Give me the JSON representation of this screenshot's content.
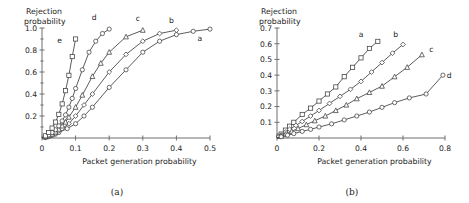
{
  "figure": {
    "panels": [
      {
        "caption": "(a)"
      },
      {
        "caption": "(b)"
      }
    ]
  },
  "chart_data": [
    {
      "type": "line",
      "panel": "(a)",
      "title": "",
      "xlabel": "Packet generation probability",
      "ylabel": "Rejection probability",
      "ylabel_line1": "Rejection",
      "ylabel_line2": "probability",
      "xlim": [
        0,
        0.5
      ],
      "ylim": [
        0,
        1.0
      ],
      "xticks": [
        0,
        0.1,
        0.2,
        0.3,
        0.4,
        0.5
      ],
      "xticklabels": [
        "0",
        "0.1",
        "0.2",
        "0.3",
        "0.4",
        "0.5"
      ],
      "yticks": [
        0.2,
        0.4,
        0.6,
        0.8,
        1.0
      ],
      "yticklabels": [
        "0.2",
        "0.4",
        "0.6",
        "0.8",
        "1.0"
      ],
      "yminorticks": [
        0.1,
        0.3,
        0.5,
        0.7,
        0.9
      ],
      "grid": false,
      "legend": "inline-curve-labels",
      "series": [
        {
          "name": "a",
          "marker": "circle",
          "label_x": 0.47,
          "label_y": 0.88,
          "x": [
            0.0,
            0.01,
            0.02,
            0.03,
            0.04,
            0.05,
            0.075,
            0.1,
            0.125,
            0.15,
            0.2,
            0.25,
            0.3,
            0.35,
            0.4,
            0.45,
            0.5
          ],
          "y": [
            0.0,
            0.005,
            0.012,
            0.022,
            0.035,
            0.05,
            0.085,
            0.13,
            0.2,
            0.28,
            0.46,
            0.62,
            0.78,
            0.88,
            0.94,
            0.97,
            0.99
          ]
        },
        {
          "name": "b",
          "marker": "diamond",
          "label_x": 0.385,
          "label_y": 1.05,
          "x": [
            0.0,
            0.01,
            0.02,
            0.03,
            0.04,
            0.05,
            0.06,
            0.08,
            0.1,
            0.125,
            0.15,
            0.2,
            0.25,
            0.3,
            0.35,
            0.4
          ],
          "y": [
            0.0,
            0.008,
            0.018,
            0.03,
            0.045,
            0.065,
            0.085,
            0.13,
            0.2,
            0.3,
            0.4,
            0.6,
            0.76,
            0.88,
            0.95,
            0.98
          ]
        },
        {
          "name": "c",
          "marker": "triangle",
          "label_x": 0.285,
          "label_y": 1.06,
          "x": [
            0.0,
            0.01,
            0.02,
            0.03,
            0.04,
            0.05,
            0.06,
            0.07,
            0.08,
            0.1,
            0.12,
            0.15,
            0.175,
            0.2,
            0.25,
            0.3
          ],
          "y": [
            0.0,
            0.01,
            0.022,
            0.036,
            0.055,
            0.08,
            0.11,
            0.145,
            0.19,
            0.28,
            0.39,
            0.56,
            0.68,
            0.78,
            0.92,
            0.98
          ]
        },
        {
          "name": "d",
          "marker": "circle",
          "label_x": 0.155,
          "label_y": 1.07,
          "x": [
            0.0,
            0.01,
            0.02,
            0.03,
            0.04,
            0.05,
            0.06,
            0.07,
            0.08,
            0.09,
            0.1,
            0.12,
            0.14,
            0.16,
            0.18,
            0.2
          ],
          "y": [
            0.0,
            0.012,
            0.028,
            0.05,
            0.075,
            0.11,
            0.155,
            0.21,
            0.28,
            0.36,
            0.45,
            0.62,
            0.78,
            0.88,
            0.95,
            0.99
          ]
        },
        {
          "name": "e",
          "marker": "square",
          "label_x": 0.052,
          "label_y": 0.86,
          "x": [
            0.0,
            0.01,
            0.02,
            0.03,
            0.04,
            0.05,
            0.06,
            0.07,
            0.08,
            0.09,
            0.1
          ],
          "y": [
            0.0,
            0.02,
            0.05,
            0.09,
            0.145,
            0.215,
            0.31,
            0.43,
            0.57,
            0.74,
            0.9
          ]
        }
      ]
    },
    {
      "type": "line",
      "panel": "(b)",
      "title": "",
      "xlabel": "Packet generation probability",
      "ylabel": "Rejection probability",
      "ylabel_line1": "Rejection",
      "ylabel_line2": "probability",
      "xlim": [
        0,
        0.8
      ],
      "ylim": [
        0,
        0.7
      ],
      "xticks": [
        0,
        0.2,
        0.4,
        0.6,
        0.8
      ],
      "xticklabels": [
        "0",
        "0.2",
        "0.4",
        "0.6",
        "0.8"
      ],
      "yticks": [
        0.1,
        0.2,
        0.3,
        0.4,
        0.5,
        0.6,
        0.7
      ],
      "yticklabels": [
        "0.1",
        "0.2",
        "0.3",
        "0.4",
        "0.5",
        "0.6",
        "0.7"
      ],
      "yminorticks": [],
      "grid": false,
      "legend": "inline-curve-labels",
      "series": [
        {
          "name": "a",
          "marker": "square",
          "label_x": 0.4,
          "label_y": 0.645,
          "x": [
            0.0,
            0.01,
            0.02,
            0.04,
            0.06,
            0.08,
            0.12,
            0.16,
            0.2,
            0.24,
            0.28,
            0.32,
            0.36,
            0.4,
            0.44,
            0.48
          ],
          "y": [
            0.0,
            0.012,
            0.025,
            0.05,
            0.075,
            0.1,
            0.15,
            0.19,
            0.235,
            0.28,
            0.325,
            0.39,
            0.45,
            0.51,
            0.57,
            0.615
          ]
        },
        {
          "name": "b",
          "marker": "diamond",
          "label_x": 0.565,
          "label_y": 0.645,
          "x": [
            0.0,
            0.01,
            0.02,
            0.04,
            0.06,
            0.09,
            0.12,
            0.16,
            0.2,
            0.25,
            0.3,
            0.35,
            0.4,
            0.45,
            0.5,
            0.55,
            0.6
          ],
          "y": [
            0.0,
            0.009,
            0.018,
            0.037,
            0.055,
            0.08,
            0.105,
            0.14,
            0.175,
            0.22,
            0.265,
            0.31,
            0.36,
            0.42,
            0.48,
            0.54,
            0.595
          ]
        },
        {
          "name": "c",
          "marker": "triangle",
          "label_x": 0.735,
          "label_y": 0.545,
          "x": [
            0.0,
            0.02,
            0.04,
            0.07,
            0.1,
            0.14,
            0.18,
            0.23,
            0.28,
            0.33,
            0.38,
            0.44,
            0.5,
            0.56,
            0.62,
            0.69
          ],
          "y": [
            0.0,
            0.012,
            0.024,
            0.042,
            0.06,
            0.085,
            0.11,
            0.14,
            0.175,
            0.21,
            0.25,
            0.29,
            0.33,
            0.39,
            0.45,
            0.53
          ]
        },
        {
          "name": "d",
          "marker": "circle",
          "label_x": 0.82,
          "label_y": 0.385,
          "x": [
            0.0,
            0.02,
            0.05,
            0.08,
            0.12,
            0.16,
            0.2,
            0.26,
            0.32,
            0.38,
            0.44,
            0.5,
            0.56,
            0.63,
            0.71,
            0.79
          ],
          "y": [
            0.0,
            0.008,
            0.018,
            0.028,
            0.042,
            0.055,
            0.07,
            0.09,
            0.115,
            0.14,
            0.165,
            0.195,
            0.225,
            0.255,
            0.28,
            0.4
          ]
        }
      ]
    }
  ]
}
